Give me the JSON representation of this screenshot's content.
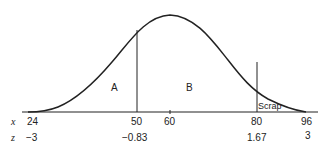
{
  "diagram": {
    "type": "normal-distribution-curve",
    "regions": [
      {
        "label": "A",
        "description": "area left of x=50"
      },
      {
        "label": "B",
        "description": "area between x=50 and x=80"
      },
      {
        "label": "Scrap",
        "description": "area right of x=80"
      }
    ],
    "axis_rows": [
      {
        "symbol": "x",
        "ticks": [
          "24",
          "50",
          "60",
          "80",
          "96"
        ]
      },
      {
        "symbol": "z",
        "ticks": [
          "−3",
          "−0.83",
          "",
          "1.67",
          "3"
        ]
      }
    ],
    "cutoffs": [
      50,
      80
    ],
    "mean": 60,
    "colors": {
      "line": "#222222",
      "background": "#ffffff"
    }
  }
}
